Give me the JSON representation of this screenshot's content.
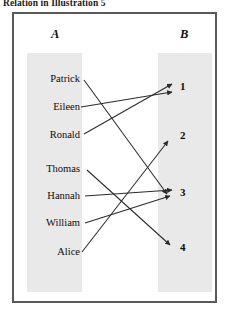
{
  "caption": "Relation in Illustration 5",
  "diagram": {
    "set_a_label": "A",
    "set_b_label": "B",
    "left_items": [
      {
        "id": "patrick",
        "label": "Patrick"
      },
      {
        "id": "eileen",
        "label": "Eileen"
      },
      {
        "id": "ronald",
        "label": "Ronald"
      },
      {
        "id": "thomas",
        "label": "Thomas"
      },
      {
        "id": "hannah",
        "label": "Hannah"
      },
      {
        "id": "william",
        "label": "William"
      },
      {
        "id": "alice",
        "label": "Alice"
      }
    ],
    "right_items": [
      {
        "id": "one",
        "label": "1"
      },
      {
        "id": "two",
        "label": "2"
      },
      {
        "id": "three",
        "label": "3"
      },
      {
        "id": "four",
        "label": "4"
      }
    ],
    "mappings": [
      {
        "from": "Patrick",
        "to": "3"
      },
      {
        "from": "Eileen",
        "to": "1"
      },
      {
        "from": "Ronald",
        "to": "1"
      },
      {
        "from": "Thomas",
        "to": "4"
      },
      {
        "from": "Hannah",
        "to": "3"
      },
      {
        "from": "William",
        "to": "3"
      },
      {
        "from": "Alice",
        "to": "2"
      }
    ],
    "colors": {
      "column_fill": "#e9e9e9",
      "frame_border": "#5a5a5a",
      "arrow": "#2b2b2b",
      "background": "#ffffff"
    }
  }
}
